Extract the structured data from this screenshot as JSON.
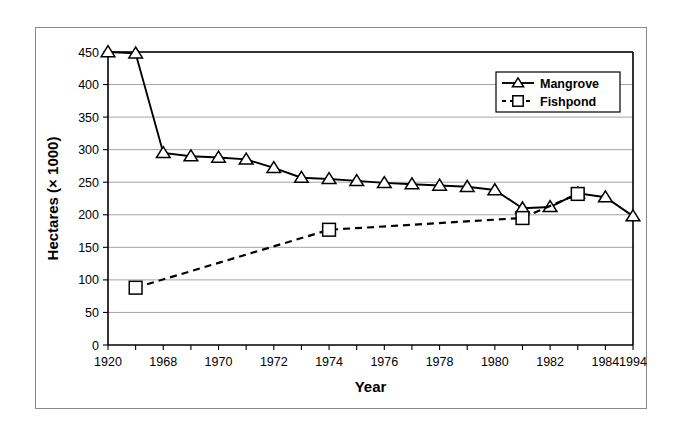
{
  "figure": {
    "border_color": "#8a8a8a",
    "background": "#ffffff"
  },
  "chart_data": {
    "type": "line",
    "title": "",
    "xlabel": "Year",
    "ylabel": "Hectares (× 1000)",
    "ylim": [
      0,
      450
    ],
    "ytick_step": 50,
    "yticks": [
      "0",
      "50",
      "100",
      "150",
      "200",
      "250",
      "300",
      "350",
      "400",
      "450"
    ],
    "grid": "horizontal",
    "legend_position": "top-right",
    "x_axis_type": "categorical",
    "categories": [
      "1920",
      "1968",
      "1969",
      "1970",
      "1971",
      "1972",
      "1973",
      "1974",
      "1975",
      "1976",
      "1977",
      "1978",
      "1979",
      "1980",
      "1981",
      "1982",
      "1983",
      "1984",
      "1985",
      "1994"
    ],
    "tick_labels": [
      "1920",
      "",
      "1968",
      "",
      "1970",
      "",
      "1972",
      "",
      "1974",
      "",
      "1976",
      "",
      "1978",
      "",
      "1980",
      "",
      "1982",
      "",
      "1984",
      "",
      "1994"
    ],
    "visible_tick_labels": [
      "1920",
      "1968",
      "1970",
      "1972",
      "1974",
      "1976",
      "1978",
      "1980",
      "1982",
      "1984",
      "1994"
    ],
    "series": [
      {
        "name": "Mangrove",
        "marker": "triangle",
        "line_style": "solid",
        "color": "#000000",
        "x": [
          "1920",
          "1968",
          "1969",
          "1970",
          "1971",
          "1972",
          "1973",
          "1974",
          "1975",
          "1976",
          "1977",
          "1978",
          "1979",
          "1980",
          "1981",
          "1982",
          "1983",
          "1984",
          "1985",
          "1994"
        ],
        "values": [
          450,
          448,
          295,
          290,
          288,
          285,
          272,
          257,
          255,
          252,
          249,
          247,
          245,
          243,
          238,
          210,
          212,
          233,
          227,
          198
        ]
      },
      {
        "name": "Fishpond",
        "marker": "square",
        "line_style": "dashed",
        "color": "#000000",
        "x": [
          "1968",
          "1975",
          "1982",
          "1984"
        ],
        "values": [
          88,
          177,
          195,
          232
        ]
      }
    ]
  },
  "legend": {
    "entries": [
      {
        "label": "Mangrove",
        "marker": "triangle",
        "line_style": "solid"
      },
      {
        "label": "Fishpond",
        "marker": "square",
        "line_style": "dashed"
      }
    ]
  }
}
